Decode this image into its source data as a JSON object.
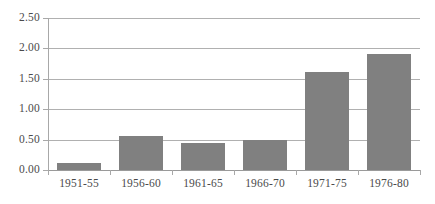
{
  "chart_data": {
    "type": "bar",
    "title": "",
    "subtitle": "",
    "xlabel": "",
    "ylabel": "",
    "categories": [
      "1951-55",
      "1956-60",
      "1961-65",
      "1966-70",
      "1971-75",
      "1976-80"
    ],
    "values": [
      0.11,
      0.56,
      0.45,
      0.5,
      1.61,
      1.9
    ],
    "series": [
      {
        "name": "",
        "values": [
          0.11,
          0.56,
          0.45,
          0.5,
          1.61,
          1.9
        ]
      }
    ],
    "ylim": [
      0.0,
      2.5
    ],
    "ytick_values": [
      0.0,
      0.5,
      1.0,
      1.5,
      2.0,
      2.5
    ],
    "ytick_labels": [
      "0.00",
      "0.50",
      "1.00",
      "1.50",
      "2.00",
      "2.50"
    ],
    "grid": true,
    "grid_axis": "y",
    "legend": false,
    "legend_position": "none",
    "bar_color": "#808080",
    "gridline_color": "#b0b0b0",
    "axis_color": "#9a9a9a",
    "text_color": "#4a4a4a",
    "background_color": "#ffffff",
    "annotations": []
  }
}
